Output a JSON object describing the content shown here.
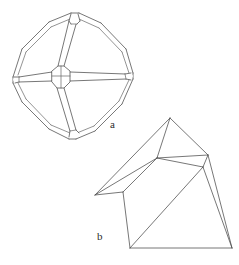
{
  "figure": {
    "type": "line-drawing",
    "background_color": "#ffffff",
    "stroke_color": "#4a4a4a",
    "label_color": "#2b2b2b",
    "panels": [
      {
        "id": "a",
        "label": "a",
        "label_x": 113,
        "label_y": 128,
        "description": "beveled octahedron with truncated vertices"
      },
      {
        "id": "b",
        "label": "b",
        "label_x": 100,
        "label_y": 240,
        "description": "wedge-shaped prismatic crystal"
      }
    ]
  },
  "shape_a": {
    "name": "octahedron-beveled",
    "outer_outline": "M 13,77 L 22,49 L 49,22 L 71,13 L 79,13 L 101,23 L 126,49 L 133,73 L 133,79 L 122,104 L 95,131 L 76,139 L 69,139 L 49,129 L 22,102 L 13,83 Z",
    "outer_ring": [
      "M 13,77 L 22,49",
      "M 22,49 L 49,22",
      "M 49,22 L 71,13",
      "M 71,13 L 79,13",
      "M 79,13 L 101,23",
      "M 101,23 L 126,49",
      "M 126,49 L 133,73",
      "M 133,73 L 133,79",
      "M 133,79 L 122,104",
      "M 122,104 L 95,131",
      "M 95,131 L 76,139",
      "M 76,139 L 69,139",
      "M 69,139 L 49,129",
      "M 49,129 L 22,102",
      "M 22,102 L 13,83",
      "M 13,83 L 13,77"
    ],
    "inner_ring": [
      "M 18,75 L 26,52",
      "M 26,52 L 51,27",
      "M 51,27 L 71,18",
      "M 79,18 L 99,28",
      "M 99,28 L 122,52",
      "M 122,52 L 129,74",
      "M 129,79 L 119,101",
      "M 119,101 L 94,126",
      "M 94,126 L 76,134",
      "M 69,134 L 51,125",
      "M 51,125 L 26,99",
      "M 26,99 L 18,82"
    ],
    "center_face": "M 52,71 L 58,66 L 64,66 L 70,71 L 70,82 L 64,88 L 57,88 L 52,82 Z",
    "center_inner_lines": [
      "M 52,76 L 70,76",
      "M 61,66 L 61,88"
    ],
    "bevel_bands": [
      "M 58,66 L 68,20",
      "M 64,66 L 76,20",
      "M 70,71 L 126,73",
      "M 70,82 L 128,78",
      "M 64,88 L 76,133",
      "M 57,88 L 70,133",
      "M 52,82 L 16,81",
      "M 52,71 L 16,77"
    ],
    "vertex_faces": {
      "top": "M 68,20 L 71,14 L 78,14 L 80,20 L 77,23 L 71,23 Z",
      "right": "M 126,72 L 132,74 L 132,80 L 128,83 L 124,80 L 124,75 Z",
      "bottom": "M 70,131 L 69,137 L 76,138 L 79,133 L 77,130 L 72,129 Z",
      "left": "M 16,76 L 13,78 L 13,83 L 17,85 L 20,82 L 20,78 Z"
    },
    "vertex_spurs": [
      "M 68,20 L 71,23",
      "M 77,23 L 80,20",
      "M 124,75 L 126,72",
      "M 124,80 L 128,83",
      "M 72,129 L 70,131",
      "M 77,130 L 79,133",
      "M 20,78 L 16,76",
      "M 20,82 L 17,85"
    ]
  },
  "shape_b": {
    "name": "wedge-prism",
    "outline": "M 170,118 L 208,155 L 232,248 L 130,248 L 123,192 L 95,195 Z",
    "edges": [
      "M 170,118 L 208,155",
      "M 208,155 L 232,248",
      "M 232,248 L 130,248",
      "M 130,248 L 123,192",
      "M 123,192 L 95,195",
      "M 95,195 L 170,118",
      "M 170,118 L 157,158",
      "M 157,158 L 208,155",
      "M 157,158 L 203,167",
      "M 203,167 L 208,155",
      "M 157,158 L 123,192",
      "M 157,158 L 95,195",
      "M 203,167 L 232,248",
      "M 203,167 L 130,248",
      "M 123,192 L 130,248"
    ],
    "top_facet": "M 170,118 L 208,155 L 157,158 Z",
    "upper_left_facet": "M 170,118 L 157,158 L 95,195 Z",
    "small_facet": "M 157,158 L 208,155 L 203,167 Z",
    "left_facet": "M 157,158 L 203,167 L 130,248 L 123,192 Z",
    "right_facet": "M 203,167 L 232,248 L 130,248 Z",
    "notch_facet": "M 95,195 L 157,158 L 123,192 Z",
    "left_band": "M 123,192 L 130,248"
  }
}
